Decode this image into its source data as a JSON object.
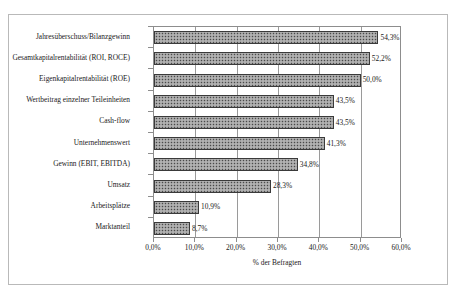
{
  "chart_data": {
    "type": "bar",
    "orientation": "horizontal",
    "title": "",
    "xlabel": "% der Befragten",
    "ylabel": "",
    "xlim": [
      0,
      60
    ],
    "grid": true,
    "legend": false,
    "xticks": [
      "0,0%",
      "10,0%",
      "20,0%",
      "30,0%",
      "40,0%",
      "50,0%",
      "60,0%"
    ],
    "xtick_values": [
      0,
      10,
      20,
      30,
      40,
      50,
      60
    ],
    "categories": [
      "Jahresüberschuss/Bilanzgewinn",
      "Gesamtkapitalrentabilität (ROI, ROCE)",
      "Eigenkapitalrentabilität (ROE)",
      "Wertbeitrag einzelner Teileinheiten",
      "Cash-flow",
      "Unternehmenswert",
      "Gewinn (EBIT, EBITDA)",
      "Umsatz",
      "Arbeitsplätze",
      "Marktanteil"
    ],
    "values": [
      54.3,
      52.2,
      50.0,
      43.5,
      43.5,
      41.3,
      34.8,
      28.3,
      10.9,
      8.7
    ],
    "value_labels": [
      "54,3%",
      "52,2%",
      "50,0%",
      "43,5%",
      "43,5%",
      "41,3%",
      "34,8%",
      "28,3%",
      "10,9%",
      "8,7%"
    ],
    "colors": {
      "bar_fill": "#9e9e9e",
      "bar_border": "#3a3a3a",
      "gridline": "#9a9a9a",
      "axis": "#8d8d8d",
      "frame": "#b9b9b9",
      "text": "#1a1a1a",
      "background": "#ffffff"
    }
  }
}
